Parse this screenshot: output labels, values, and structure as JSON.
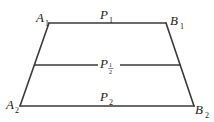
{
  "diagram": {
    "type": "trapezoid",
    "points": {
      "A1": {
        "name": "A",
        "sub": "1",
        "x": 49,
        "y": 23
      },
      "B1": {
        "name": "B",
        "sub": "1",
        "x": 166,
        "y": 23
      },
      "A2": {
        "name": "A",
        "sub": "2",
        "x": 20,
        "y": 106
      },
      "B2": {
        "name": "B",
        "sub": "2",
        "x": 194,
        "y": 106
      }
    },
    "lines": {
      "top": {
        "label": "P",
        "sub": "1"
      },
      "middle": {
        "label": "P",
        "sub_num": "1",
        "sub_den": "2"
      },
      "bottom": {
        "label": "P",
        "sub": "2"
      }
    },
    "colors": {
      "stroke": "#3a3a3a",
      "text": "#222222"
    }
  }
}
